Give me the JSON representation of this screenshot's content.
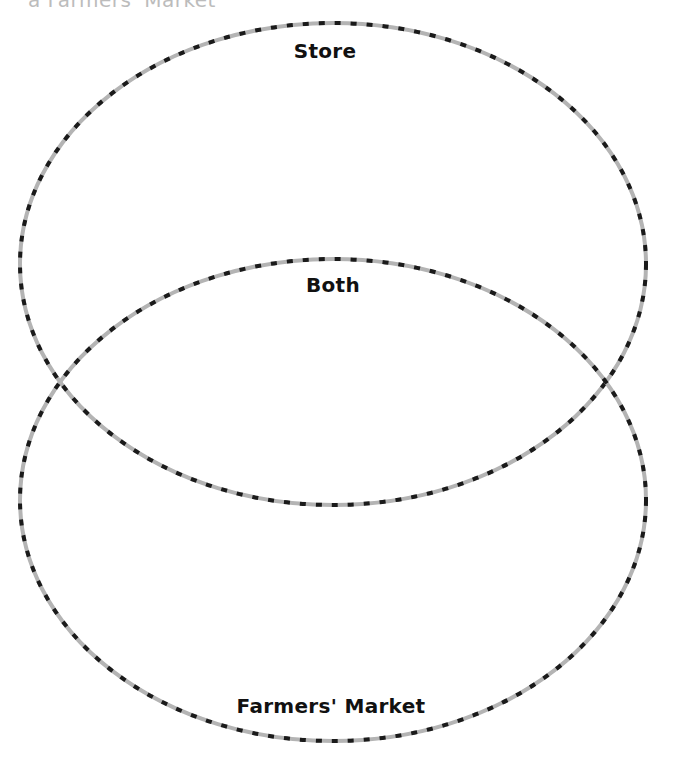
{
  "header": {
    "partial_title": "a Farmers' Market"
  },
  "diagram": {
    "type": "venn",
    "orientation": "vertical",
    "sets": [
      {
        "id": "store",
        "label": "Store"
      },
      {
        "id": "farmers",
        "label": "Farmers' Market"
      }
    ],
    "intersection": {
      "label": "Both"
    },
    "stroke": {
      "style": "dashed",
      "dash_color": "#1a1a1a",
      "base_color": "#b4b4b4"
    }
  }
}
